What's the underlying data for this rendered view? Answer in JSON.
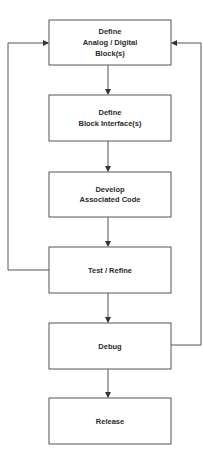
{
  "diagram": {
    "type": "flowchart",
    "colors": {
      "stroke": "#555555",
      "text": "#2a2a2a",
      "background": "#ffffff"
    },
    "nodes": [
      {
        "id": "define-blocks",
        "lines": [
          "Define",
          "Analog / Digital",
          "Block(s)"
        ]
      },
      {
        "id": "define-interfaces",
        "lines": [
          "Define",
          "Block Interface(s)"
        ]
      },
      {
        "id": "develop-code",
        "lines": [
          "Develop",
          "Associated Code"
        ]
      },
      {
        "id": "test-refine",
        "lines": [
          "Test / Refine"
        ]
      },
      {
        "id": "debug",
        "lines": [
          "Debug"
        ]
      },
      {
        "id": "release",
        "lines": [
          "Release"
        ]
      }
    ],
    "edges": [
      {
        "from": "define-blocks",
        "to": "define-interfaces"
      },
      {
        "from": "define-interfaces",
        "to": "develop-code"
      },
      {
        "from": "develop-code",
        "to": "test-refine"
      },
      {
        "from": "test-refine",
        "to": "debug"
      },
      {
        "from": "debug",
        "to": "release"
      },
      {
        "from": "test-refine",
        "to": "define-blocks",
        "route": "left-feedback"
      },
      {
        "from": "debug",
        "to": "define-blocks",
        "route": "right-feedback"
      }
    ]
  }
}
